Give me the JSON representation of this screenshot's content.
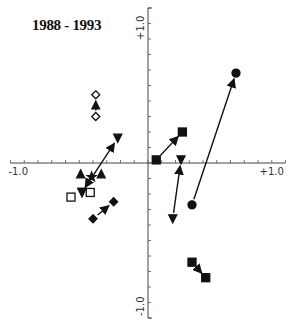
{
  "title": "1988 - 1993",
  "chart_data": {
    "type": "scatter",
    "title": "1988 - 1993",
    "xlabel": "",
    "ylabel": "",
    "xlim": [
      -1.0,
      1.0
    ],
    "ylim": [
      -1.0,
      1.0
    ],
    "grid": false,
    "axes_through_origin": true,
    "tick_labels": {
      "x_min": "-1.0",
      "x_max": "+1.0",
      "y_max": "+1.0",
      "y_min": "-1.0"
    },
    "tick_step": 0.1,
    "series": [
      {
        "name": "open-diamond",
        "marker": "diamond-open",
        "from": {
          "x": -0.38,
          "y": 0.3
        },
        "to": {
          "x": -0.38,
          "y": 0.44
        }
      },
      {
        "name": "filled-down-triangle-left",
        "marker": "triangle-down-filled",
        "from": {
          "x": -0.48,
          "y": -0.19
        },
        "to": {
          "x": -0.22,
          "y": 0.16
        }
      },
      {
        "name": "star-cluster",
        "marker": "star-filled",
        "from": {
          "x": -0.41,
          "y": -0.09
        },
        "to": {
          "x": -0.48,
          "y": -0.19
        }
      },
      {
        "name": "filled-up-triangle-pair",
        "marker": "triangle-up-filled",
        "points": [
          {
            "x": -0.49,
            "y": -0.07
          },
          {
            "x": -0.34,
            "y": -0.07
          }
        ]
      },
      {
        "name": "open-square-pair",
        "marker": "square-open",
        "points": [
          {
            "x": -0.56,
            "y": -0.22
          },
          {
            "x": -0.42,
            "y": -0.19
          }
        ]
      },
      {
        "name": "filled-diamond",
        "marker": "diamond-filled",
        "from": {
          "x": -0.4,
          "y": -0.36
        },
        "to": {
          "x": -0.25,
          "y": -0.25
        }
      },
      {
        "name": "filled-square-upper",
        "marker": "square-filled",
        "from": {
          "x": 0.06,
          "y": 0.02
        },
        "to": {
          "x": 0.25,
          "y": 0.2
        }
      },
      {
        "name": "filled-triangle-right",
        "marker": "triangle-down-filled",
        "from": {
          "x": 0.18,
          "y": -0.36
        },
        "to": {
          "x": 0.24,
          "y": 0.02
        }
      },
      {
        "name": "filled-circle",
        "marker": "circle-filled",
        "from": {
          "x": 0.32,
          "y": -0.27
        },
        "to": {
          "x": 0.64,
          "y": 0.58
        }
      },
      {
        "name": "filled-square-lower",
        "marker": "square-filled",
        "from": {
          "x": 0.32,
          "y": -0.64
        },
        "to": {
          "x": 0.42,
          "y": -0.74
        }
      }
    ]
  }
}
